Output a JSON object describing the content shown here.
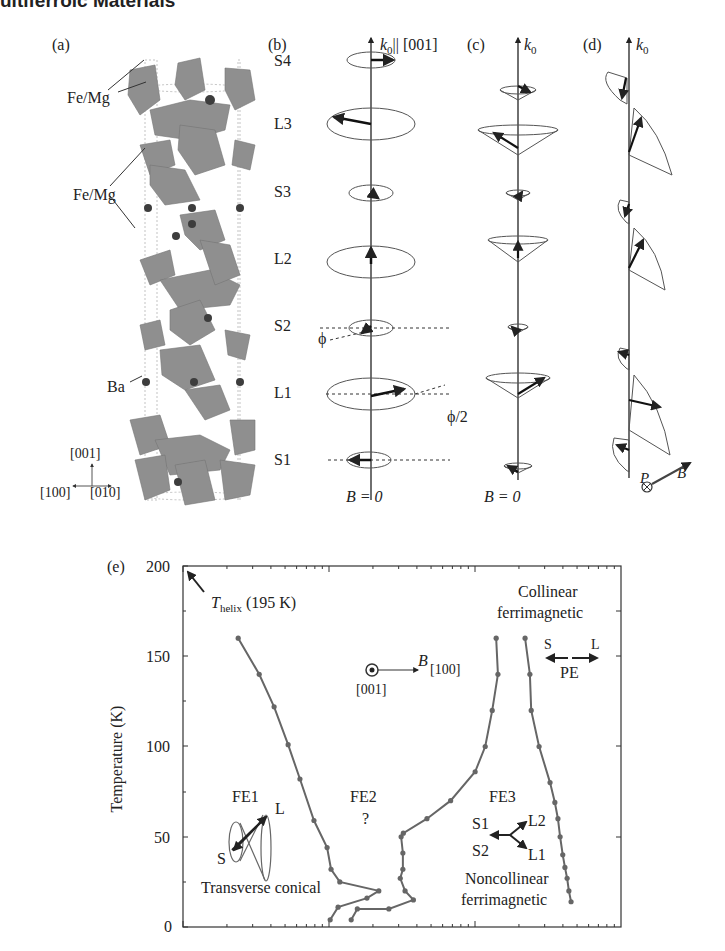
{
  "header": {
    "running_title": "ultiferroic Materials"
  },
  "panels": {
    "a": {
      "label": "(a)",
      "atom_labels": [
        "Fe/Mg",
        "Fe/Mg",
        "Ba"
      ],
      "axes": {
        "up": "[001]",
        "left": "[100]",
        "right": "[010]"
      }
    },
    "b": {
      "label": "(b)",
      "axis_label": "k0|| [001]",
      "axis_k": "k",
      "axis_sub": "0",
      "axis_rest": "|| [001]",
      "layers": [
        "S4",
        "L3",
        "S3",
        "L2",
        "S2",
        "L1",
        "S1"
      ],
      "phi": "ϕ",
      "phi_half": "ϕ/2",
      "field": "B = 0"
    },
    "c": {
      "label": "(c)",
      "axis_k": "k",
      "axis_sub": "0",
      "field": "B = 0"
    },
    "d": {
      "label": "(d)",
      "axis_k": "k",
      "axis_sub": "0",
      "p_label": "P",
      "b_label": "B"
    }
  },
  "chart_data": {
    "type": "line",
    "title": "",
    "panel_label": "(e)",
    "ylabel": "Temperature (K)",
    "xlabel": "",
    "ylim": [
      0,
      200
    ],
    "yticks": [
      0,
      50,
      100,
      150,
      200
    ],
    "x_scale": "log (unlabeled)",
    "grid": false,
    "annotations": [
      "T_helix (195 K)",
      "Collinear ferrimagnetic",
      "PE",
      "FE1",
      "FE2 ?",
      "FE3",
      "Transverse conical",
      "Noncollinear ferrimagnetic",
      "B [100]",
      "[001]",
      "S",
      "L",
      "S1",
      "S2",
      "L1",
      "L2"
    ],
    "series": [
      {
        "name": "FE1/FE2 boundary",
        "x_norm": [
          0.126,
          0.174,
          0.208,
          0.24,
          0.267,
          0.299,
          0.329,
          0.338,
          0.358,
          0.447,
          0.42,
          0.354,
          0.336
        ],
        "T": [
          160,
          140,
          122,
          101,
          82,
          59,
          44,
          32,
          25,
          20,
          16,
          11,
          4
        ]
      },
      {
        "name": "FE2/FE3 boundary",
        "x_norm": [
          0.715,
          0.719,
          0.706,
          0.69,
          0.667,
          0.611,
          0.557,
          0.503,
          0.498,
          0.502,
          0.502,
          0.496,
          0.507,
          0.526,
          0.47,
          0.398,
          0.384
        ],
        "T": [
          160,
          140,
          120,
          100,
          86,
          70,
          60,
          52,
          50,
          41,
          32,
          27,
          20,
          15,
          10,
          10,
          4
        ]
      },
      {
        "name": "FE3/PE boundary",
        "x_norm": [
          0.781,
          0.792,
          0.795,
          0.813,
          0.838,
          0.849,
          0.856,
          0.861,
          0.867,
          0.872,
          0.877,
          0.881,
          0.886
        ],
        "T": [
          160,
          140,
          120,
          100,
          80,
          69,
          60,
          50,
          40,
          33,
          27,
          20,
          14
        ]
      }
    ]
  },
  "labels": {
    "thelix_T": "T",
    "thelix_sub": "helix",
    "thelix_rest": " (195 K)",
    "collinear1": "Collinear",
    "collinear2": "ferrimagnetic",
    "pe": "PE",
    "s": "S",
    "l": "L",
    "fe1": "FE1",
    "fe2": "FE2",
    "fe2q": "?",
    "fe3": "FE3",
    "tc": "Transverse conical",
    "nc1": "Noncollinear",
    "nc2": "ferrimagnetic",
    "b": "B",
    "b100": "[100]",
    "n001": "[001]",
    "s1": "S1",
    "s2": "S2",
    "l1": "L1",
    "l2": "L2",
    "y0": "0",
    "y50": "50",
    "y100": "100",
    "y150": "150",
    "y200": "200"
  }
}
